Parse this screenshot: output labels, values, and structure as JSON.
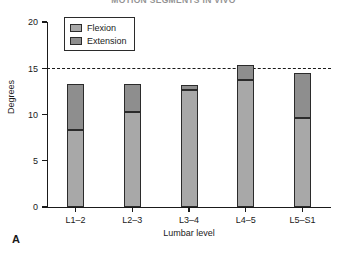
{
  "panel": {
    "letter": "A"
  },
  "chart_data": {
    "type": "bar",
    "subtype": "stacked-bar",
    "title": "MOTION SEGMENTS IN VIVO",
    "xlabel": "Lumbar level",
    "ylabel": "Degrees",
    "categories": [
      "L1–2",
      "L2–3",
      "L3–4",
      "L4–5",
      "L5–S1"
    ],
    "series": [
      {
        "name": "Flexion",
        "color": "#a8a8a8",
        "values": [
          8.3,
          10.3,
          12.6,
          13.7,
          9.6
        ]
      },
      {
        "name": "Extension",
        "color": "#8e8e8e",
        "values": [
          5.0,
          3.0,
          0.6,
          1.7,
          4.9
        ]
      }
    ],
    "totals": [
      13.3,
      13.3,
      13.2,
      15.4,
      14.5
    ],
    "ylim": [
      0,
      20
    ],
    "yticks": [
      0,
      5,
      10,
      15,
      20
    ],
    "ytick_labels": [
      "0",
      "5",
      "10",
      "15",
      "20"
    ],
    "grid": false,
    "legend_position": "top-left",
    "annotations": [
      {
        "type": "reference-line",
        "orientation": "horizontal",
        "value": 15,
        "style": "dashed"
      }
    ]
  },
  "legend": {
    "entries": [
      {
        "label": "Flexion"
      },
      {
        "label": "Extension"
      }
    ]
  }
}
